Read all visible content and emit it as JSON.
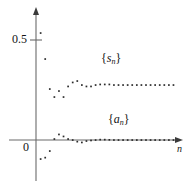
{
  "chart_data": {
    "type": "scatter",
    "title": "",
    "xlabel": "n",
    "ylabel": "",
    "grid": false,
    "legend_position": "inline-annotations",
    "axis": {
      "x_axis_y_value": 0,
      "y_tick_labels": [
        "0",
        "0.5"
      ],
      "y_tick_values": [
        0,
        0.5
      ],
      "x_tick_labels": [],
      "xlim": [
        0,
        30
      ],
      "ylim": [
        -0.15,
        0.62
      ],
      "x_arrow": true,
      "y_arrow": true
    },
    "annotations": [
      {
        "text": "{s_n}",
        "x": 13.5,
        "y": 0.4
      },
      {
        "text": "{a_n}",
        "x": 15.0,
        "y": 0.145
      }
    ],
    "point_color": "#2b2b2b",
    "axis_color": "#6b6b6b",
    "series": [
      {
        "name": "{s_n}",
        "marker": "dot",
        "x": [
          1,
          2,
          3,
          4,
          5,
          6,
          7,
          8,
          9,
          10,
          11,
          12,
          13,
          14,
          15,
          16,
          17,
          18,
          19,
          20,
          21,
          22,
          23,
          24,
          25,
          26,
          27,
          28,
          29,
          30
        ],
        "values": [
          0.535,
          0.405,
          0.255,
          0.215,
          0.245,
          0.215,
          0.268,
          0.288,
          0.295,
          0.275,
          0.268,
          0.268,
          0.275,
          0.278,
          0.278,
          0.278,
          0.275,
          0.275,
          0.275,
          0.275,
          0.275,
          0.275,
          0.275,
          0.275,
          0.275,
          0.275,
          0.275,
          0.275,
          0.275,
          0.275
        ]
      },
      {
        "name": "{a_n}",
        "marker": "dot",
        "x": [
          1,
          2,
          3,
          4,
          5,
          6,
          7,
          8,
          9,
          10,
          11,
          12,
          13,
          14,
          15,
          16,
          17,
          18,
          19,
          20,
          21,
          22,
          23,
          24,
          25,
          26,
          27,
          28,
          29,
          30
        ],
        "values": [
          -0.095,
          -0.088,
          -0.055,
          0.005,
          0.028,
          0.018,
          0.005,
          0.0,
          -0.008,
          -0.012,
          -0.005,
          -0.002,
          0.0,
          0.002,
          0.002,
          0.001,
          0.0,
          0.0,
          0.0,
          0.0,
          0.0,
          0.0,
          0.0,
          0.0,
          0.0,
          0.0,
          0.0,
          0.0,
          0.0,
          0.0
        ]
      }
    ]
  },
  "labels": {
    "y_half": "0.5",
    "y_zero": "0",
    "x_axis_name": "n",
    "series_s_open": "{",
    "series_s_var": "s",
    "series_s_sub": "n",
    "series_s_close": "}",
    "series_a_open": "{",
    "series_a_var": "a",
    "series_a_sub": "n",
    "series_a_close": "}"
  }
}
